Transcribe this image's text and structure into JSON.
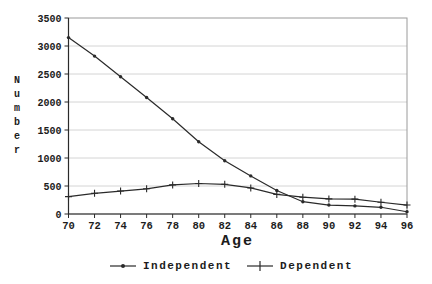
{
  "chart_data": {
    "type": "line",
    "x": [
      70,
      72,
      74,
      76,
      78,
      80,
      82,
      84,
      86,
      88,
      90,
      92,
      94,
      96
    ],
    "series": [
      {
        "name": "Independent",
        "marker": "dot",
        "values": [
          3150,
          2820,
          2450,
          2080,
          1700,
          1290,
          950,
          680,
          420,
          220,
          160,
          145,
          120,
          40
        ]
      },
      {
        "name": "Dependent",
        "marker": "plus",
        "values": [
          310,
          370,
          410,
          450,
          520,
          545,
          530,
          465,
          350,
          300,
          270,
          265,
          210,
          160
        ]
      }
    ],
    "title": "",
    "xlabel": "Age",
    "ylabel": "Number",
    "ylim": [
      0,
      3500
    ],
    "ytick_step": 500,
    "grid": "horizontal",
    "legend_position": "bottom-center"
  },
  "axes": {
    "y_ticks": [
      "3500",
      "3000",
      "2500",
      "2000",
      "1500",
      "1000",
      "500",
      "0"
    ],
    "x_ticks": [
      "70",
      "72",
      "74",
      "76",
      "78",
      "80",
      "82",
      "84",
      "86",
      "88",
      "90",
      "92",
      "94",
      "96"
    ],
    "xlabel": "Age",
    "ylabel_stacked": "N\nu\nm\nb\ne\nr"
  },
  "legend": {
    "items": [
      {
        "label": "Independent",
        "marker": "line-dot"
      },
      {
        "label": "Dependent",
        "marker": "line-plus"
      }
    ]
  },
  "colors": {
    "line": "#2a2a2a",
    "grid": "#d4d4d4",
    "frame": "#9a9a9a",
    "axis": "#2a2a2a",
    "text": "#1c1c1c",
    "background": "#ffffff"
  }
}
